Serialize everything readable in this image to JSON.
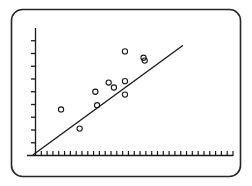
{
  "figure": {
    "title": "",
    "frame_label": "plot-frame",
    "background_color": "#ffffff",
    "ink_color": "#1a1a1a",
    "frame_color": "#262626"
  },
  "chart_data": {
    "type": "scatter",
    "title": "",
    "subtitle": "",
    "xlabel": "",
    "ylabel": "",
    "legend": [],
    "legend_position": "none",
    "grid": false,
    "axis_tick_labels": {
      "x": [],
      "y": []
    },
    "x_tick_count": 34,
    "y_tick_count": 9,
    "xlim": [
      0,
      34
    ],
    "ylim": [
      0,
      9
    ],
    "points": [
      {
        "x": 4.4,
        "y": 3.25,
        "label": ""
      },
      {
        "x": 7.6,
        "y": 1.9,
        "label": ""
      },
      {
        "x": 10.3,
        "y": 4.5,
        "label": ""
      },
      {
        "x": 10.6,
        "y": 3.55,
        "label": ""
      },
      {
        "x": 12.6,
        "y": 5.15,
        "label": ""
      },
      {
        "x": 13.5,
        "y": 4.8,
        "label": ""
      },
      {
        "x": 15.4,
        "y": 7.35,
        "label": ""
      },
      {
        "x": 15.4,
        "y": 5.25,
        "label": ""
      },
      {
        "x": 15.4,
        "y": 4.3,
        "label": ""
      },
      {
        "x": 18.6,
        "y": 6.9,
        "label": ""
      },
      {
        "x": 18.8,
        "y": 6.7,
        "label": ""
      }
    ],
    "fit_line": {
      "name": "regression-line",
      "start": {
        "x": -0.4,
        "y": 0.05
      },
      "end": {
        "x": 25.3,
        "y": 7.75
      },
      "style": "solid"
    },
    "marker": {
      "shape": "open-circle",
      "radius_px": 2.6,
      "stroke_color": "#1a1a1a",
      "fill_color": "none"
    }
  }
}
